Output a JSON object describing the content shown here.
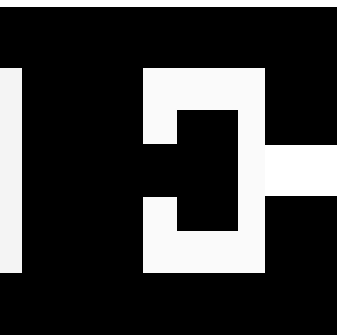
{
  "image": {
    "description": "Abstract black and white geometric block composition",
    "width": 342,
    "height": 336
  },
  "colors": {
    "background": "#ffffff",
    "ink": "#000000",
    "paper": "#f6f6f6"
  },
  "shapes": [
    {
      "name": "black-field",
      "x": 0,
      "y": 7,
      "w": 337,
      "h": 328,
      "color": "#000000"
    },
    {
      "name": "left-white-strip",
      "x": 0,
      "y": 68,
      "w": 22,
      "h": 205,
      "color": "#f4f4f4"
    },
    {
      "name": "center-white-region",
      "x": 143,
      "y": 68,
      "w": 122,
      "h": 205,
      "color": "#fafafa"
    },
    {
      "name": "right-white-notch",
      "x": 265,
      "y": 145,
      "w": 77,
      "h": 51,
      "color": "#ffffff"
    },
    {
      "name": "left-black-tab",
      "x": 143,
      "y": 144,
      "w": 34,
      "h": 53,
      "color": "#000000"
    },
    {
      "name": "inner-black-square",
      "x": 177,
      "y": 110,
      "w": 61,
      "h": 121,
      "color": "#000000"
    }
  ]
}
